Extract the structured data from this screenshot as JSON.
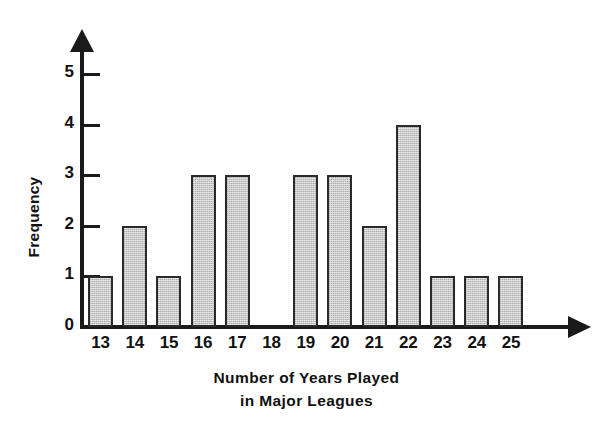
{
  "chart_data": {
    "type": "bar",
    "title": "",
    "xlabel": "Number of Years Played in Major Leagues",
    "xlabel_line1": "Number of Years Played",
    "xlabel_line2": "in Major Leagues",
    "ylabel": "Frequency",
    "categories": [
      "13",
      "14",
      "15",
      "16",
      "17",
      "18",
      "19",
      "20",
      "21",
      "22",
      "23",
      "24",
      "25"
    ],
    "values": [
      1,
      2,
      1,
      3,
      3,
      0,
      3,
      3,
      2,
      4,
      1,
      1,
      1
    ],
    "ylim": [
      0,
      5
    ],
    "yticks": [
      "0",
      "1",
      "2",
      "3",
      "4",
      "5"
    ],
    "grid": false,
    "legend": false,
    "bar_fill_color": "#c9c9c9",
    "bar_edge_color": "#2a2a2a",
    "axis_color": "#1a1a1a",
    "background_color": "#ffffff"
  }
}
